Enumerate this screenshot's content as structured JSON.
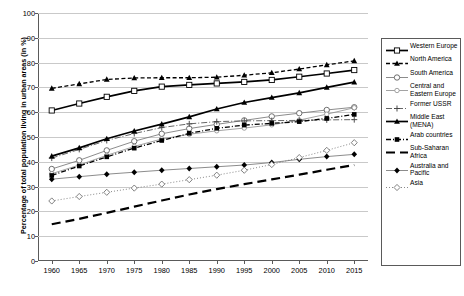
{
  "chart_data": {
    "type": "line",
    "title": "",
    "xlabel": "",
    "ylabel": "Percentage of total population living in urban areas (in %)",
    "x": [
      1960,
      1965,
      1970,
      1975,
      1980,
      1985,
      1990,
      1995,
      2000,
      2005,
      2010,
      2015
    ],
    "xlim": [
      1957.5,
      2017.5
    ],
    "ylim": [
      0,
      100
    ],
    "ytick_step": 10,
    "yticks": [
      0,
      10,
      20,
      30,
      40,
      50,
      60,
      70,
      80,
      90,
      100
    ],
    "xticks": [
      "1960",
      "1965",
      "1970",
      "1975",
      "1980",
      "1985",
      "1990",
      "1995",
      "2000",
      "2005",
      "2010",
      "2015"
    ],
    "grid": true,
    "legend_position": "right",
    "series": [
      {
        "name": "Western Europe",
        "marker": "open-square",
        "line": "solid-thick",
        "values": [
          60.7,
          63.5,
          66.2,
          68.6,
          70.3,
          71.0,
          71.6,
          72.2,
          73.0,
          74.3,
          75.6,
          77.0
        ]
      },
      {
        "name": "North America",
        "marker": "filled-triangle",
        "line": "dashed",
        "values": [
          69.6,
          71.4,
          73.2,
          73.8,
          73.9,
          73.9,
          74.1,
          74.9,
          75.9,
          77.4,
          79.1,
          80.7
        ]
      },
      {
        "name": "South America",
        "marker": "open-circle",
        "line": "solid-thin",
        "values": [
          37.1,
          40.6,
          44.6,
          48.3,
          51.3,
          53.4,
          55.1,
          56.7,
          58.3,
          59.6,
          60.9,
          62.0
        ]
      },
      {
        "name": "Central and Eastern Europe",
        "marker": "open-circle-small",
        "line": "solid-thin-light",
        "values": [
          35.2,
          38.7,
          42.6,
          46.2,
          49.2,
          51.1,
          52.5,
          53.6,
          54.9,
          56.8,
          59.2,
          61.8
        ]
      },
      {
        "name": "Former USSR",
        "marker": "plus",
        "line": "dash-dot",
        "values": [
          41.5,
          45.0,
          48.6,
          51.4,
          53.8,
          55.3,
          56.2,
          56.5,
          56.6,
          56.7,
          56.9,
          57.0
        ]
      },
      {
        "name": "Middle East (MENA)",
        "marker": "filled-triangle",
        "line": "solid-thick",
        "values": [
          42.3,
          45.6,
          49.3,
          52.4,
          55.2,
          58.1,
          61.3,
          63.9,
          65.9,
          67.8,
          70.0,
          72.1
        ]
      },
      {
        "name": "Arab countries",
        "marker": "filled-square",
        "line": "dash-dot-thick",
        "values": [
          34.5,
          38.3,
          42.0,
          45.5,
          48.6,
          51.5,
          53.5,
          54.8,
          55.5,
          56.2,
          57.5,
          59.1
        ]
      },
      {
        "name": "Sub-Saharan Africa",
        "marker": "none",
        "line": "long-dash-thick",
        "values": [
          14.8,
          17.0,
          19.4,
          21.9,
          24.4,
          26.8,
          29.0,
          31.0,
          32.9,
          34.8,
          36.8,
          38.7
        ]
      },
      {
        "name": "Australia and Pacific",
        "marker": "filled-diamond",
        "line": "solid-thin",
        "values": [
          33.0,
          34.0,
          35.0,
          35.8,
          36.6,
          37.3,
          38.0,
          38.7,
          39.7,
          41.0,
          42.1,
          43.0
        ]
      },
      {
        "name": "Asia",
        "marker": "open-diamond",
        "line": "dotted",
        "values": [
          24.2,
          26.0,
          27.7,
          29.4,
          31.0,
          32.8,
          34.6,
          36.6,
          38.9,
          41.7,
          44.6,
          47.7
        ]
      }
    ]
  },
  "legend": {
    "items": [
      {
        "label": "Western Europe"
      },
      {
        "label": "North America"
      },
      {
        "label": "South America"
      },
      {
        "label": "Central and Eastern Europe"
      },
      {
        "label": "Former USSR"
      },
      {
        "label": "Middle East (MENA)"
      },
      {
        "label": "Arab countries"
      },
      {
        "label": "Sub-Saharan Africa"
      },
      {
        "label": "Australia and Pacific"
      },
      {
        "label": "Asia"
      }
    ]
  },
  "colors": {
    "axis": "#5a5a5a",
    "grid": "#c9c9c9",
    "ink": "#000000",
    "light_ink": "#8c8c8c",
    "background": "#ffffff"
  }
}
